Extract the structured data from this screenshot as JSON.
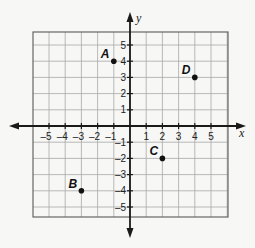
{
  "diagram": {
    "type": "coordinate-plane",
    "x_axis_label": "x",
    "y_axis_label": "y",
    "x_ticks": [
      "-5",
      "-4",
      "-3",
      "-2",
      "-1",
      "1",
      "2",
      "3",
      "4",
      "5"
    ],
    "y_ticks": [
      "5",
      "4",
      "3",
      "2",
      "1",
      "-1",
      "-2",
      "-3",
      "-4",
      "-5"
    ],
    "range": {
      "x": [
        -6,
        6
      ],
      "y": [
        -6,
        6
      ]
    },
    "points": [
      {
        "label": "A",
        "x": -1,
        "y": 4
      },
      {
        "label": "B",
        "x": -3,
        "y": -4
      },
      {
        "label": "C",
        "x": 2,
        "y": -2
      },
      {
        "label": "D",
        "x": 4,
        "y": 3
      }
    ]
  },
  "colors": {
    "grid": "#a8a8a8",
    "axis": "#1a1a1a",
    "background": "#f7f7f5"
  }
}
